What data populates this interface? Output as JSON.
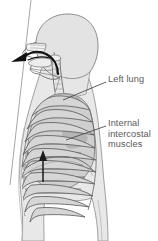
{
  "figure": {
    "background_color": "#ffffff",
    "labels": [
      {
        "id": "left-lung",
        "text": "Left lung",
        "color": "#58585a",
        "leader_from": [
          63,
          100
        ],
        "leader_to": [
          106,
          82
        ]
      },
      {
        "id": "internal-intercostal-muscles",
        "text_lines": [
          "Internal",
          "intercostal",
          "muscles"
        ],
        "color": "#58585a",
        "leader_from": [
          66,
          140
        ],
        "leader_to": [
          106,
          126
        ]
      }
    ],
    "arrows": [
      {
        "id": "exhalation-airflow-arrow",
        "description": "curved arrow from trachea out through mouth and nose",
        "color": "#1a1a1a"
      },
      {
        "id": "rib-elevation-arrow",
        "description": "straight upward arrow within the intercostal muscles",
        "color": "#1a1a1a"
      }
    ],
    "anatomy": [
      {
        "id": "head-and-neck-profile",
        "fill": "#e3e3e3",
        "stroke": "#8a8a8a"
      },
      {
        "id": "nasal-cavity",
        "fill": "#f2f2f2",
        "stroke": "#6e6e6e"
      },
      {
        "id": "oral-cavity-and-tongue",
        "fill": "#ededed",
        "stroke": "#6e6e6e"
      },
      {
        "id": "pharynx-and-trachea",
        "fill": "#f0f0f0",
        "stroke": "#6e6e6e"
      },
      {
        "id": "torso-silhouette",
        "fill": "#e6e6e6",
        "stroke": "#9a9a9a"
      },
      {
        "id": "left-lung-shape",
        "fill": "#cfcfcf",
        "stroke": "#7a7a7a"
      },
      {
        "id": "rib-cage",
        "fill": "#d8d8d8",
        "stroke": "#5f5f5f",
        "rib_count": 11
      },
      {
        "id": "internal-intercostal-hatching",
        "stroke": "#2b2b2b"
      },
      {
        "id": "diaphragm",
        "stroke": "#6a6a6a"
      },
      {
        "id": "frame-border-line",
        "stroke": "#9a9a9a"
      }
    ]
  }
}
